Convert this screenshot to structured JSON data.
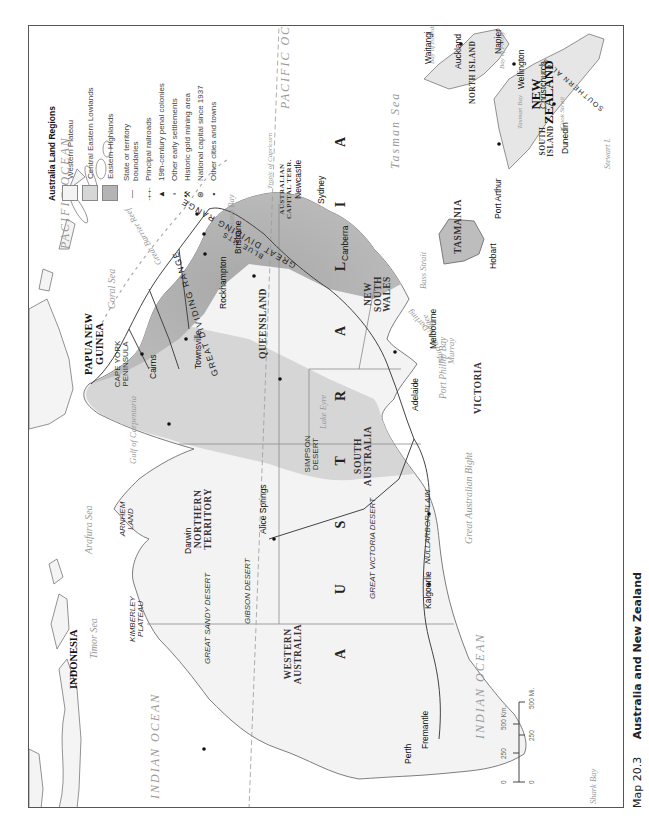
{
  "caption": {
    "number": "Map 20.3",
    "title": "Australia and New Zealand"
  },
  "legend": {
    "title": "Australia Land Regions",
    "regions": [
      {
        "label": "Western Plateau",
        "color": "#f3f3f3"
      },
      {
        "label": "Central Eastern Lowlands",
        "color": "#d6d6d6"
      },
      {
        "label": "Eastern Highlands",
        "color": "#b4b4b4"
      }
    ],
    "symbols": [
      {
        "icon": "boundary-line-icon",
        "glyph": "—",
        "label": "State or territory boundaries"
      },
      {
        "icon": "railroad-icon",
        "glyph": "-+-+-",
        "label": "Principal railroads"
      },
      {
        "icon": "penal-colony-triangle-icon",
        "glyph": "▲",
        "label": "19th-century penal colonies"
      },
      {
        "icon": "early-settlement-square-icon",
        "glyph": "▫",
        "label": "Other early settlements"
      },
      {
        "icon": "gold-mining-crossed-picks-icon",
        "glyph": "⚒",
        "label": "Historic gold mining area"
      },
      {
        "icon": "national-capital-icon",
        "glyph": "⊛",
        "label": "National capital since 1937"
      },
      {
        "icon": "city-dot-icon",
        "glyph": "•",
        "label": "Other cities and towns"
      }
    ]
  },
  "scale_bar": {
    "km_labels": [
      "0",
      "250",
      "500 Km."
    ],
    "mi_labels": [
      "0",
      "250",
      "500 Mi."
    ]
  },
  "oceans_and_seas": {
    "pacific_1": "PACIFIC OCEAN",
    "pacific_2": "PACIFIC OCEAN",
    "indian_1": "INDIAN OCEAN",
    "indian_2": "INDIAN OCEAN",
    "tasman": "Tasman Sea",
    "coral": "Coral Sea",
    "arafura": "Arafura Sea",
    "timor": "Timor Sea",
    "gulf_carpentaria": "Gulf of Carpentaria",
    "great_australian_bight": "Great Australian Bight",
    "bass_strait": "Bass Strait",
    "port_phillip": "Port Phillip Bay",
    "botany_bay": "Botany Bay",
    "shark_bay": "Shark Bay",
    "great_barrier_reef": "Great Barrier Reef",
    "tropic": "Tropic of Capricorn",
    "bay_of_islands": "Bay of Islands",
    "bay_of_plenty": "Bay of Plenty",
    "tasman_bay": "Tasman Bay",
    "cook_strait": "Cook Strait"
  },
  "countries": {
    "australia": "A U S T R A L I A",
    "indonesia": "INDONESIA",
    "papua_new_guinea": "PAPUA NEW GUINEA",
    "new_zealand": "NEW ZEALAND"
  },
  "states": {
    "western_australia": "WESTERN AUSTRALIA",
    "northern_territory": "NORTHERN TERRITORY",
    "south_australia": "SOUTH AUSTRALIA",
    "queensland": "QUEENSLAND",
    "new_south_wales": "NEW SOUTH WALES",
    "victoria": "VICTORIA",
    "tasmania": "TASMANIA",
    "act": "AUSTRALIAN CAPITAL TERR.",
    "north_island": "NORTH ISLAND",
    "south_island": "SOUTH ISLAND"
  },
  "regions": {
    "kimberley": "KIMBERLEY PLATEAU",
    "arnhem": "ARNHEM LAND",
    "cape_york": "CAPE YORK PENINSULA",
    "great_sandy": "GREAT SANDY DESERT",
    "gibson": "GIBSON DESERT",
    "great_victoria": "GREAT VICTORIA DESERT",
    "nullarbor": "NULLARBOR PLAIN",
    "simpson": "SIMPSON DESERT",
    "great_dividing_range_n": "GREAT DIVIDING RANGE",
    "great_dividing_range_s": "GREAT DIVIDING RANGE",
    "blue_mts": "BLUE MTS",
    "southern_alps": "SOUTHERN ALPS",
    "lake_eyre": "Lake Eyre",
    "darling": "Darling",
    "murrumbidgee": "Murrumbidgee",
    "murray": "Murray",
    "stewart_island": "Stewart I."
  },
  "cities": {
    "darwin": "Darwin",
    "cairns": "Cairns",
    "townsville": "Townsville",
    "rockhampton": "Rockhampton",
    "brisbane": "Brisbane",
    "newcastle": "Newcastle",
    "sydney": "Sydney",
    "canberra": "Canberra",
    "melbourne": "Melbourne",
    "adelaide": "Adelaide",
    "alice_springs": "Alice Springs",
    "kalgoorlie": "Kalgoorlie",
    "perth": "Perth",
    "fremantle": "Fremantle",
    "hobart": "Hobart",
    "port_arthur": "Port Arthur",
    "waitangi": "Waitangi",
    "auckland": "Auckland",
    "napier": "Napier",
    "wellington": "Wellington",
    "christchurch": "Christchurch",
    "dunedin": "Dunedin"
  }
}
